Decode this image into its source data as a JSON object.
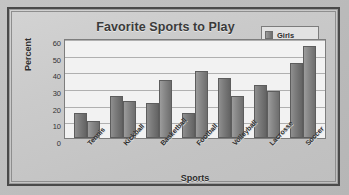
{
  "chart_data": {
    "type": "bar",
    "title": "Favorite Sports to Play",
    "xlabel": "Sports",
    "ylabel": "Percent",
    "categories": [
      "Tennis",
      "Kickball",
      "Basketball",
      "Football",
      "Volleyball",
      "Lacrosse",
      "Soccer"
    ],
    "series": [
      {
        "name": "Girls",
        "values": [
          15,
          25,
          21,
          15,
          36,
          32,
          45
        ],
        "color": "#7a7a7a"
      },
      {
        "name": "Boys",
        "values": [
          10,
          22,
          35,
          40,
          25,
          28,
          55
        ],
        "color": "#868686"
      }
    ],
    "ylim": [
      0,
      60
    ],
    "yticks": [
      60,
      50,
      40,
      30,
      20,
      10,
      0
    ],
    "grid": true,
    "legend_position": "top-right"
  },
  "legend": {
    "entries": [
      {
        "label": "Girls",
        "swatch": "legend-swatch-girls"
      },
      {
        "label": "Boys",
        "swatch": "legend-swatch-boys"
      }
    ]
  }
}
